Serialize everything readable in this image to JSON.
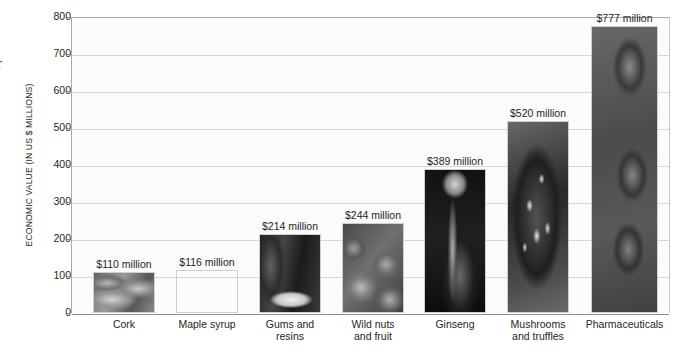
{
  "edge_glyph": "r",
  "chart_data": {
    "type": "bar",
    "title": "",
    "xlabel": "",
    "ylabel": "ECONOMIC VALUE (IN US $ MILLIONS)",
    "ylim": [
      0,
      800
    ],
    "ytick_step": 100,
    "yticks": [
      "800",
      "700",
      "600",
      "500",
      "400",
      "300",
      "200",
      "100",
      "0"
    ],
    "grid": true,
    "legend": "none",
    "units": "US $ millions",
    "categories": [
      "Cork",
      "Maple syrup",
      "Gums and resins",
      "Wild nuts and fruit",
      "Ginseng",
      "Mushrooms and truffles",
      "Pharmaceuticals"
    ],
    "values": [
      110,
      116,
      214,
      244,
      389,
      520,
      777
    ],
    "data_labels": [
      "$110 million",
      "$116 million",
      "$214 million",
      "$244 million",
      "$389 million",
      "$520 million",
      "$777 million"
    ],
    "bars": [
      {
        "category": "Cork",
        "category_lines": [
          "Cork"
        ],
        "value": 110,
        "label": "$110 million",
        "fill": "photo-cork",
        "photo_tone": "#7b7368"
      },
      {
        "category": "Maple syrup",
        "category_lines": [
          "Maple syrup"
        ],
        "value": 116,
        "label": "$116 million",
        "fill": "photo-maple-syrup",
        "photo_tone": "#6e6a62"
      },
      {
        "category": "Gums and resins",
        "category_lines": [
          "Gums and",
          "resins"
        ],
        "value": 214,
        "label": "$214 million",
        "fill": "photo-gums-resins",
        "photo_tone": "#474440"
      },
      {
        "category": "Wild nuts and fruit",
        "category_lines": [
          "Wild nuts",
          "and fruit"
        ],
        "value": 244,
        "label": "$244 million",
        "fill": "photo-wild-nuts",
        "photo_tone": "#5e574e"
      },
      {
        "category": "Ginseng",
        "category_lines": [
          "Ginseng"
        ],
        "value": 389,
        "label": "$389 million",
        "fill": "photo-ginseng",
        "photo_tone": "#1b1a18"
      },
      {
        "category": "Mushrooms and truffles",
        "category_lines": [
          "Mushrooms",
          "and truffles"
        ],
        "value": 520,
        "label": "$520 million",
        "fill": "photo-mushrooms",
        "photo_tone": "#3c3a36"
      },
      {
        "category": "Pharmaceuticals",
        "category_lines": [
          "Pharmaceuticals"
        ],
        "value": 777,
        "label": "$777 million",
        "fill": "photo-pharmaceuticals",
        "photo_tone": "#555250"
      }
    ]
  },
  "colors": {
    "background": "#ffffff",
    "plot_background": "#fbfbfb",
    "gridline": "#d6d6d6",
    "axis": "#8d8d8d",
    "text": "#231f20"
  }
}
